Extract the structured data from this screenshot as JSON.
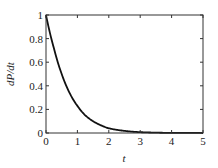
{
  "chart_data": {
    "type": "line",
    "title": "",
    "xlabel": "t",
    "ylabel": "dP/dt",
    "xlim": [
      0,
      5
    ],
    "ylim": [
      0,
      1
    ],
    "xticks": [
      0,
      1,
      2,
      3,
      4,
      5
    ],
    "yticks": [
      0,
      0.2,
      0.4,
      0.6,
      0.8,
      1
    ],
    "xtick_labels": [
      "0",
      "1",
      "2",
      "3",
      "4",
      "5"
    ],
    "ytick_labels": [
      "0",
      "0.2",
      "0.4",
      "0.6",
      "0.8",
      "1"
    ],
    "grid": false,
    "legend": null,
    "series": [
      {
        "name": "dP/dt",
        "color": "#111111",
        "x": [
          0,
          0.25,
          0.5,
          0.75,
          1.0,
          1.25,
          1.5,
          1.75,
          2.0,
          2.5,
          3.0,
          3.5,
          4.0,
          4.5,
          5.0
        ],
        "y": [
          1.0,
          0.72,
          0.5,
          0.34,
          0.23,
          0.15,
          0.1,
          0.065,
          0.04,
          0.018,
          0.007,
          0.003,
          0.001,
          0.0005,
          0.0002
        ]
      }
    ]
  }
}
